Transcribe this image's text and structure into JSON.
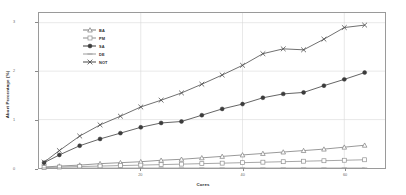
{
  "chart_data": {
    "type": "line",
    "title": "",
    "xlabel": "Cores",
    "ylabel": "Abort Percentage (%)",
    "xlim": [
      0,
      68
    ],
    "ylim": [
      0,
      3.2
    ],
    "xticks": [
      20,
      40,
      60
    ],
    "xtick_labels": [
      "20",
      "40",
      "60"
    ],
    "yticks": [
      0,
      1,
      2,
      3
    ],
    "ytick_labels": [
      "0",
      "1",
      "2",
      "3"
    ],
    "grid": true,
    "legend_position": "upper left",
    "x": [
      1,
      4,
      8,
      12,
      16,
      20,
      24,
      28,
      32,
      36,
      40,
      44,
      48,
      52,
      56,
      60,
      64
    ],
    "series": [
      {
        "name": "BA",
        "marker": "triangle",
        "color": "#7d7d7d",
        "values": [
          0.02,
          0.04,
          0.06,
          0.09,
          0.11,
          0.13,
          0.16,
          0.18,
          0.21,
          0.24,
          0.27,
          0.3,
          0.33,
          0.36,
          0.39,
          0.43,
          0.47
        ]
      },
      {
        "name": "PM",
        "marker": "square",
        "color": "#8f8f8f",
        "values": [
          0.01,
          0.02,
          0.03,
          0.04,
          0.05,
          0.06,
          0.07,
          0.08,
          0.09,
          0.1,
          0.11,
          0.12,
          0.13,
          0.14,
          0.15,
          0.16,
          0.17
        ]
      },
      {
        "name": "SA",
        "marker": "circle",
        "color": "#3c3c3c",
        "values": [
          0.11,
          0.27,
          0.46,
          0.6,
          0.72,
          0.84,
          0.93,
          0.96,
          1.09,
          1.22,
          1.32,
          1.45,
          1.53,
          1.56,
          1.7,
          1.83,
          1.97
        ]
      },
      {
        "name": "DE",
        "marker": "dash",
        "color": "#9c9c9c",
        "values": [
          0.0,
          0.0,
          0.0,
          0.0,
          0.0,
          0.0,
          0.0,
          0.0,
          0.0,
          0.0,
          0.0,
          0.0,
          0.0,
          0.0,
          0.0,
          0.0,
          0.0
        ]
      },
      {
        "name": "NOT",
        "marker": "cross",
        "color": "#4a4a4a",
        "values": [
          0.12,
          0.36,
          0.66,
          0.89,
          1.07,
          1.26,
          1.4,
          1.55,
          1.73,
          1.92,
          2.12,
          2.36,
          2.46,
          2.44,
          2.66,
          2.9,
          2.95
        ]
      }
    ]
  },
  "legend": {
    "entries": [
      {
        "label": "BA"
      },
      {
        "label": "PM"
      },
      {
        "label": "SA"
      },
      {
        "label": "DE"
      },
      {
        "label": "NOT"
      }
    ]
  },
  "axes": {
    "x_title": "Cores",
    "y_title": "Abort Percentage (%)"
  }
}
